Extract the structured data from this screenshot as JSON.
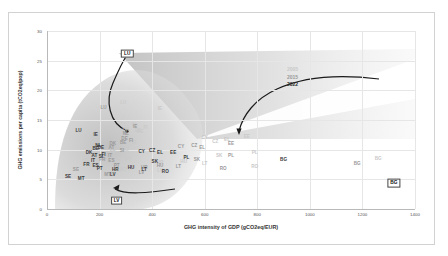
{
  "chart_data": {
    "type": "scatter",
    "title": "",
    "xlabel": "GHG intensity of GDP (gCO2eq/EUR)",
    "ylabel": "GHG emissions per capita (tCO2eq/pop)",
    "xlim": [
      0,
      1400
    ],
    "ylim": [
      0,
      30
    ],
    "xticks": [
      "0",
      "200",
      "400",
      "600",
      "800",
      "1000",
      "1200",
      "1400"
    ],
    "yticks": [
      "0",
      "5",
      "10",
      "15",
      "20",
      "25",
      "30"
    ],
    "grid": true,
    "legend_position": "upper-right-inside",
    "legend": [
      {
        "label": "2005",
        "color": "#c9c9c9"
      },
      {
        "label": "2015",
        "color": "#9a9a9a"
      },
      {
        "label": "2022",
        "color": "#3a3a3a"
      }
    ],
    "series": [
      {
        "name": "2005",
        "color": "#c9c9c9",
        "points": [
          {
            "label": "LU",
            "x": 290,
            "y": 17.8
          },
          {
            "label": "IE",
            "x": 430,
            "y": 16.8
          },
          {
            "label": "NL",
            "x": 335,
            "y": 14.1
          },
          {
            "label": "DE",
            "x": 345,
            "y": 13.2
          },
          {
            "label": "BE",
            "x": 355,
            "y": 13.0
          },
          {
            "label": "FI",
            "x": 375,
            "y": 13.6
          },
          {
            "label": "DK",
            "x": 300,
            "y": 13.3
          },
          {
            "label": "AT",
            "x": 285,
            "y": 11.5
          },
          {
            "label": "SI",
            "x": 330,
            "y": 11.1
          },
          {
            "label": "IT",
            "x": 275,
            "y": 10.6
          },
          {
            "label": "FR",
            "x": 250,
            "y": 9.4
          },
          {
            "label": "ES",
            "x": 300,
            "y": 10.0
          },
          {
            "label": "CY",
            "x": 600,
            "y": 12.0
          },
          {
            "label": "CZ",
            "x": 640,
            "y": 11.3
          },
          {
            "label": "EL",
            "x": 685,
            "y": 11.7
          },
          {
            "label": "EE",
            "x": 760,
            "y": 12.1
          },
          {
            "label": "PL",
            "x": 790,
            "y": 9.4
          },
          {
            "label": "SK",
            "x": 655,
            "y": 8.9
          },
          {
            "label": "PT",
            "x": 310,
            "y": 8.2
          },
          {
            "label": "HU",
            "x": 520,
            "y": 8.0
          },
          {
            "label": "LT",
            "x": 600,
            "y": 7.6
          },
          {
            "label": "HR",
            "x": 430,
            "y": 7.7
          },
          {
            "label": "RO",
            "x": 790,
            "y": 7.1
          },
          {
            "label": "BG",
            "x": 1260,
            "y": 8.4
          },
          {
            "label": "LV",
            "x": 430,
            "y": 6.4
          },
          {
            "label": "MT",
            "x": 290,
            "y": 6.6
          },
          {
            "label": "SE",
            "x": 150,
            "y": 8.1
          }
        ]
      },
      {
        "name": "2015",
        "color": "#9a9a9a",
        "points": [
          {
            "label": "LU",
            "x": 215,
            "y": 17.0
          },
          {
            "label": "IE",
            "x": 335,
            "y": 13.9
          },
          {
            "label": "NL",
            "x": 300,
            "y": 12.6
          },
          {
            "label": "DE",
            "x": 295,
            "y": 11.8
          },
          {
            "label": "BE",
            "x": 290,
            "y": 11.2
          },
          {
            "label": "FI",
            "x": 320,
            "y": 11.5
          },
          {
            "label": "DK",
            "x": 250,
            "y": 11.0
          },
          {
            "label": "AT",
            "x": 245,
            "y": 10.3
          },
          {
            "label": "SI",
            "x": 285,
            "y": 9.7
          },
          {
            "label": "IT",
            "x": 240,
            "y": 8.9
          },
          {
            "label": "FR",
            "x": 210,
            "y": 8.3
          },
          {
            "label": "ES",
            "x": 245,
            "y": 8.1
          },
          {
            "label": "CY",
            "x": 510,
            "y": 10.5
          },
          {
            "label": "CZ",
            "x": 560,
            "y": 10.7
          },
          {
            "label": "EL",
            "x": 590,
            "y": 10.2
          },
          {
            "label": "EE",
            "x": 700,
            "y": 11.0
          },
          {
            "label": "PL",
            "x": 700,
            "y": 9.0
          },
          {
            "label": "SK",
            "x": 570,
            "y": 8.2
          },
          {
            "label": "PT",
            "x": 265,
            "y": 7.3
          },
          {
            "label": "HU",
            "x": 430,
            "y": 7.2
          },
          {
            "label": "LT",
            "x": 500,
            "y": 7.0
          },
          {
            "label": "HR",
            "x": 370,
            "y": 6.9
          },
          {
            "label": "RO",
            "x": 670,
            "y": 6.7
          },
          {
            "label": "BG",
            "x": 1180,
            "y": 7.6
          },
          {
            "label": "LV",
            "x": 360,
            "y": 6.1
          },
          {
            "label": "MT",
            "x": 230,
            "y": 5.8
          },
          {
            "label": "SE",
            "x": 110,
            "y": 6.5
          }
        ]
      },
      {
        "name": "2022",
        "color": "#3a3a3a",
        "points": [
          {
            "label": "LU",
            "x": 120,
            "y": 13.2
          },
          {
            "label": "IE",
            "x": 185,
            "y": 12.4
          },
          {
            "label": "NL",
            "x": 195,
            "y": 10.6
          },
          {
            "label": "DE",
            "x": 205,
            "y": 10.2
          },
          {
            "label": "BE",
            "x": 185,
            "y": 10.1
          },
          {
            "label": "FI",
            "x": 215,
            "y": 9.1
          },
          {
            "label": "DK",
            "x": 160,
            "y": 9.4
          },
          {
            "label": "AT",
            "x": 180,
            "y": 9.0
          },
          {
            "label": "SI",
            "x": 205,
            "y": 8.8
          },
          {
            "label": "IT",
            "x": 175,
            "y": 8.1
          },
          {
            "label": "FR",
            "x": 150,
            "y": 7.4
          },
          {
            "label": "ES",
            "x": 185,
            "y": 7.3
          },
          {
            "label": "CY",
            "x": 360,
            "y": 9.6
          },
          {
            "label": "CZ",
            "x": 400,
            "y": 9.7
          },
          {
            "label": "EL",
            "x": 430,
            "y": 9.4
          },
          {
            "label": "EE",
            "x": 480,
            "y": 9.5
          },
          {
            "label": "PL",
            "x": 530,
            "y": 8.6
          },
          {
            "label": "SK",
            "x": 410,
            "y": 7.9
          },
          {
            "label": "PT",
            "x": 200,
            "y": 6.7
          },
          {
            "label": "HU",
            "x": 320,
            "y": 6.9
          },
          {
            "label": "LT",
            "x": 370,
            "y": 6.6
          },
          {
            "label": "HR",
            "x": 260,
            "y": 6.6
          },
          {
            "label": "RO",
            "x": 450,
            "y": 6.3
          },
          {
            "label": "BG",
            "x": 900,
            "y": 8.2
          },
          {
            "label": "LV",
            "x": 250,
            "y": 5.7
          },
          {
            "label": "MT",
            "x": 130,
            "y": 5.1
          },
          {
            "label": "SE",
            "x": 80,
            "y": 5.4
          }
        ]
      }
    ],
    "annotations": [
      {
        "label": "LU",
        "x": 305,
        "y": 26.2,
        "boxed": true
      },
      {
        "label": "LV",
        "x": 265,
        "y": 1.4,
        "boxed": true
      },
      {
        "label": "BG",
        "x": 1320,
        "y": 4.4,
        "boxed": true
      }
    ],
    "trajectory_arrows": [
      {
        "name": "lu-arrow",
        "from": "LU 2005",
        "to": "LU 2022"
      },
      {
        "name": "lv-arrow",
        "from": "LV 2005",
        "to": "LV 2022"
      },
      {
        "name": "bg-arrow",
        "from": "BG 2005",
        "to": "BG 2022"
      }
    ]
  }
}
